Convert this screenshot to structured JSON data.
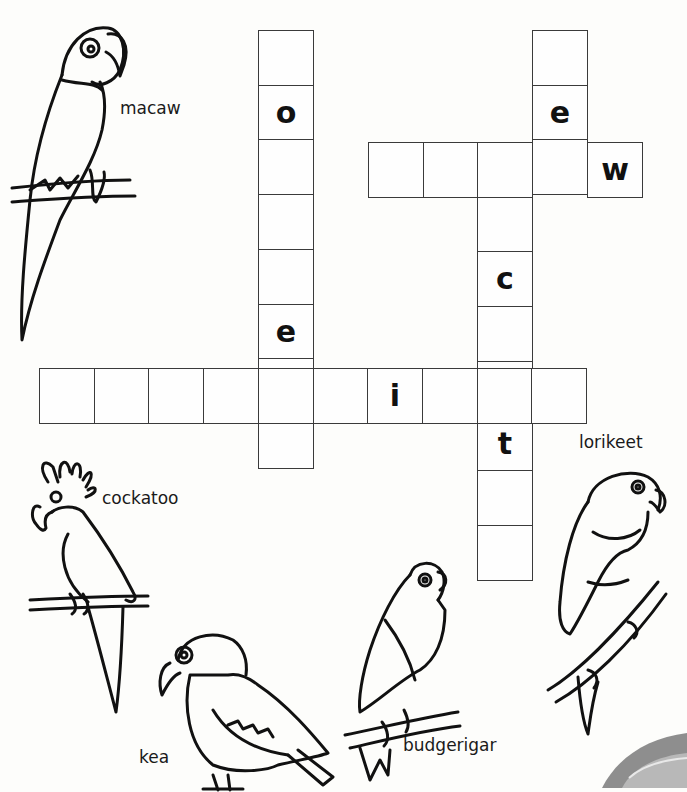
{
  "puzzle": {
    "type": "crossword",
    "cell_size": 54.7,
    "words": [
      {
        "id": "lorikeet",
        "answer": "lorikeet",
        "direction": "down",
        "x": 258,
        "y": 30,
        "length": 8,
        "given": {
          "1": "o",
          "5": "e"
        }
      },
      {
        "id": "kea",
        "answer": "kea",
        "direction": "down",
        "x": 532,
        "y": 30,
        "length": 3,
        "given": {
          "1": "e"
        }
      },
      {
        "id": "macaw",
        "answer": "macaw",
        "direction": "across",
        "x": 368,
        "y": 142,
        "length": 5,
        "given": {
          "4": "w"
        }
      },
      {
        "id": "cockatoo",
        "answer": "cockatoo",
        "direction": "down",
        "x": 477,
        "y": 142,
        "length": 8,
        "given": {
          "2": "c",
          "5": "t"
        }
      },
      {
        "id": "budgerigar",
        "answer": "budgerigar",
        "direction": "across",
        "x": 39,
        "y": 368,
        "length": 10,
        "given": {
          "6": "i"
        }
      }
    ]
  },
  "labels": {
    "macaw": "macaw",
    "cockatoo": "cockatoo",
    "kea": "kea",
    "budgerigar": "budgerigar",
    "lorikeet": "lorikeet"
  }
}
